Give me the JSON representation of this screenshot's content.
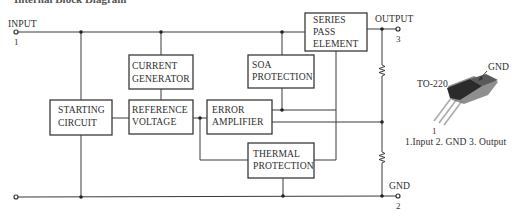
{
  "title": {
    "text": "Internal Block Diagram",
    "visible_state": "clipped at top edge"
  },
  "terminals": [
    {
      "name": "INPUT",
      "pin": "1"
    },
    {
      "name": "OUTPUT",
      "pin": "3"
    },
    {
      "name": "GND",
      "pin": "2"
    }
  ],
  "blocks": {
    "current_generator": {
      "line1": "CURRENT",
      "line2": "GENERATOR"
    },
    "series_pass_element": {
      "line1": "SERIES",
      "line2": "PASS",
      "line3": "ELEMENT"
    },
    "soa_protection": {
      "line1": "SOA",
      "line2": "PROTECTION"
    },
    "starting_circuit": {
      "line1": "STARTING",
      "line2": "CIRCUIT"
    },
    "reference_voltage": {
      "line1": "REFERENCE",
      "line2": "VOLTAGE"
    },
    "error_amplifier": {
      "line1": "ERROR",
      "line2": "AMPLIFIER"
    },
    "thermal_protection": {
      "line1": "THERMAL",
      "line2": "PROTECTION"
    }
  },
  "components": {
    "resistor_upper": "feedback-resistor",
    "resistor_lower": "feedback-resistor"
  },
  "package": {
    "name": "TO-220",
    "tab_label": "GND",
    "pin1_label": "1",
    "pinout": "1.Input 2. GND 3. Output"
  },
  "colors": {
    "line": "#3a3a3a",
    "text": "#2e2e2e",
    "package_body": "#2b2b2b",
    "package_tab": "#6a6a6a",
    "background": "#ffffff"
  }
}
